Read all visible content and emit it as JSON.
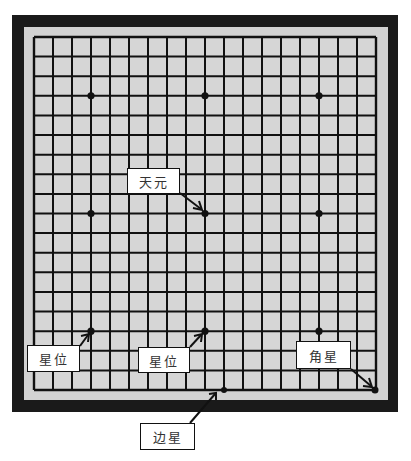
{
  "board": {
    "size": 19,
    "frame_color": "#1a1a1a",
    "border_color": "#d2d2d2",
    "cell_color": "#d6d6d6",
    "line_color": "#111111",
    "star_points": [
      [
        3,
        3
      ],
      [
        9,
        3
      ],
      [
        15,
        3
      ],
      [
        3,
        9
      ],
      [
        9,
        9
      ],
      [
        15,
        9
      ],
      [
        3,
        15
      ],
      [
        9,
        15
      ],
      [
        15,
        15
      ]
    ]
  },
  "labels": {
    "tengen": "天元",
    "star_left": "星位",
    "star_mid": "星位",
    "corner_star": "角星",
    "edge_star": "边星"
  }
}
